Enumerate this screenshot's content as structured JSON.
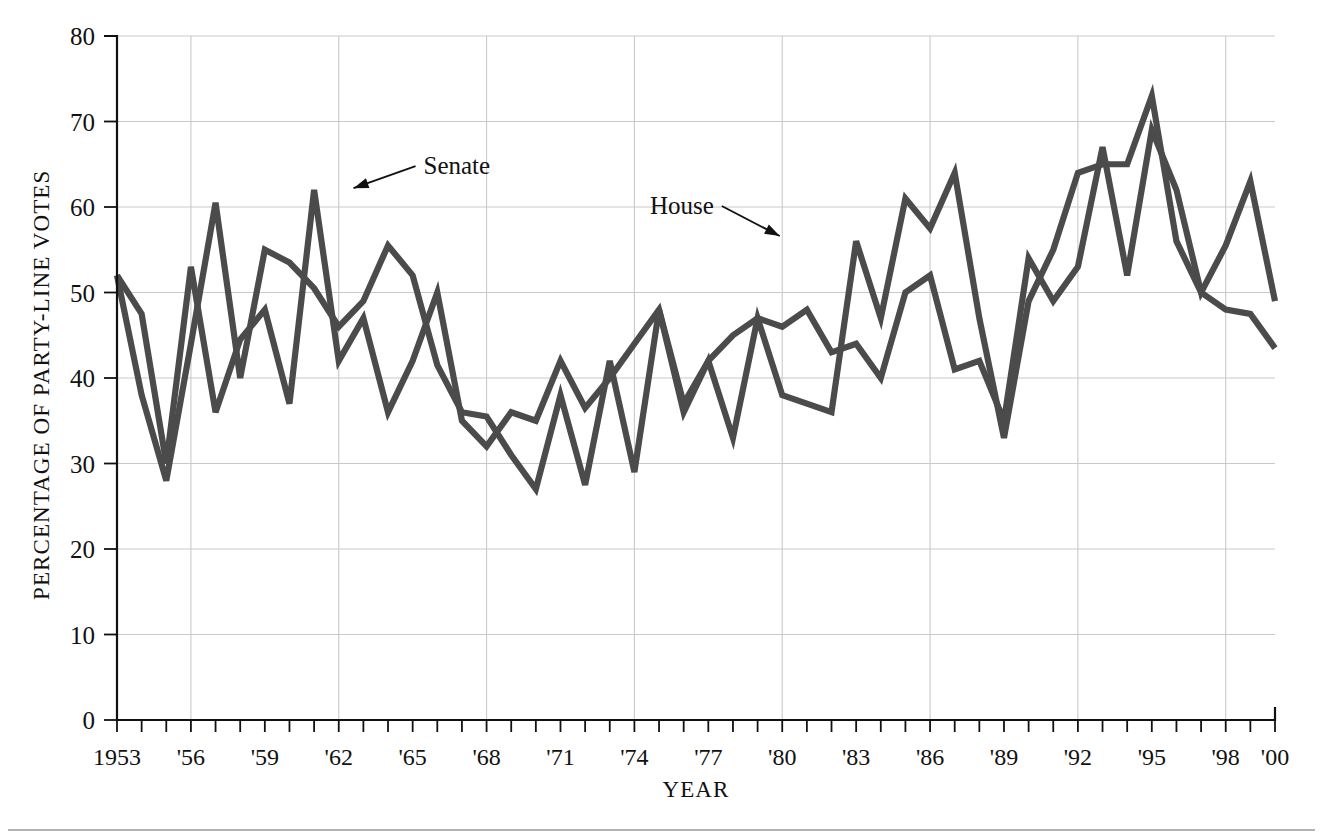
{
  "figure": {
    "background_color": "#ffffff",
    "line_color": "#4b4b4b",
    "grid_color": "#c9c9c9",
    "axis_color": "#111111"
  },
  "axes": {
    "ylabel": "PERCENTAGE OF PARTY-LINE VOTES",
    "xlabel": "YEAR",
    "ytick_labels": [
      "0",
      "10",
      "20",
      "30",
      "40",
      "50",
      "60",
      "70",
      "80"
    ],
    "xtick_labels": [
      "1953",
      "'56",
      "'59",
      "'62",
      "'65",
      "'68",
      "'71",
      "'74",
      "'77",
      "'80",
      "'83",
      "'86",
      "'89",
      "'92",
      "'95",
      "'98",
      "'00"
    ]
  },
  "annotations": [
    {
      "label": "Senate",
      "x_year": 1962.6,
      "y_value": 62.2
    },
    {
      "label": "House",
      "x_year": 1979.9,
      "y_value": 56.6
    }
  ],
  "chart_data": {
    "type": "line",
    "title": "",
    "xlabel": "YEAR",
    "ylabel": "PERCENTAGE OF PARTY-LINE VOTES",
    "xlim": [
      1953,
      2000
    ],
    "ylim": [
      0,
      80
    ],
    "ytick_step": 10,
    "xtick_step": 3,
    "grid": "both",
    "legend": "inline-annotations",
    "x": [
      1953,
      1954,
      1955,
      1956,
      1957,
      1958,
      1959,
      1960,
      1961,
      1962,
      1963,
      1964,
      1965,
      1966,
      1967,
      1968,
      1969,
      1970,
      1971,
      1972,
      1973,
      1974,
      1975,
      1976,
      1977,
      1978,
      1979,
      1980,
      1981,
      1982,
      1983,
      1984,
      1985,
      1986,
      1987,
      1988,
      1989,
      1990,
      1991,
      1992,
      1993,
      1994,
      1995,
      1996,
      1997,
      1998,
      1999,
      2000
    ],
    "series": [
      {
        "name": "Senate",
        "color": "#4b4b4b",
        "values": [
          52.0,
          47.5,
          30.0,
          53.0,
          36.0,
          44.5,
          48.0,
          37.0,
          62.0,
          42.0,
          47.0,
          36.0,
          42.0,
          50.0,
          35.0,
          32.0,
          36.0,
          35.0,
          42.0,
          36.5,
          40.0,
          44.0,
          48.0,
          37.0,
          42.0,
          45.0,
          47.0,
          46.0,
          48.0,
          43.0,
          44.0,
          40.0,
          50.0,
          52.0,
          41.0,
          42.0,
          35.0,
          54.0,
          49.0,
          53.0,
          67.0,
          52.0,
          69.0,
          62.0,
          50.0,
          55.5,
          63.0,
          49.0
        ]
      },
      {
        "name": "House",
        "color": "#4b4b4b",
        "values": [
          52.0,
          38.0,
          28.0,
          44.0,
          60.5,
          40.0,
          55.0,
          53.5,
          50.5,
          46.0,
          49.0,
          55.5,
          52.0,
          41.5,
          36.0,
          35.5,
          31.0,
          27.0,
          38.0,
          27.5,
          42.0,
          29.0,
          48.0,
          36.0,
          42.0,
          33.0,
          47.0,
          38.0,
          37.0,
          36.0,
          56.0,
          47.0,
          61.0,
          57.5,
          64.0,
          47.0,
          33.0,
          49.0,
          55.0,
          64.0,
          65.0,
          65.0,
          73.0,
          56.0,
          50.0,
          48.0,
          47.5,
          43.5
        ]
      }
    ]
  }
}
